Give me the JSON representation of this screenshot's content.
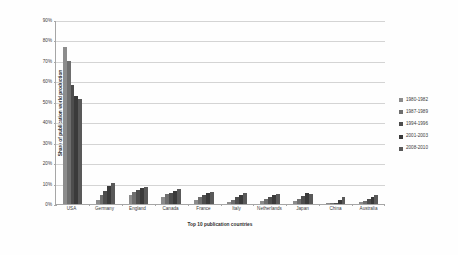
{
  "chart_data": {
    "type": "bar",
    "title": "",
    "subtitle": "",
    "xlabel": "Top 10 publication countries",
    "ylabel": "Share of publication world production",
    "categories": [
      "USA",
      "Germany",
      "England",
      "Canada",
      "France",
      "Italy",
      "Netherlands",
      "Japan",
      "China",
      "Australia"
    ],
    "ylim": [
      0,
      90
    ],
    "ytick_labels": [
      "90%",
      "80%",
      "70%",
      "60%",
      "50%",
      "40%",
      "30%",
      "20%",
      "10%",
      "0%"
    ],
    "ytick_values": [
      90,
      80,
      70,
      60,
      50,
      40,
      30,
      20,
      10,
      0
    ],
    "yaxis_unit": "%",
    "grid": true,
    "grid_axis": "y",
    "legend_position": "right",
    "series": [
      {
        "name": "1980-1982",
        "color": "#8c8c8c",
        "values": [
          77.0,
          2.0,
          4.5,
          3.6,
          2.2,
          1.0,
          1.4,
          1.6,
          0.2,
          1.0
        ]
      },
      {
        "name": "1987-1989",
        "color": "#6e6e6e",
        "values": [
          70.0,
          4.2,
          6.0,
          4.8,
          3.2,
          2.0,
          2.6,
          2.6,
          0.3,
          1.6
        ]
      },
      {
        "name": "1994-1996",
        "color": "#4d4d4d",
        "values": [
          58.0,
          6.6,
          7.0,
          5.6,
          4.6,
          3.4,
          3.6,
          4.0,
          0.5,
          2.4
        ]
      },
      {
        "name": "2001-2003",
        "color": "#3a3a3a",
        "values": [
          53.0,
          9.0,
          7.8,
          6.4,
          5.4,
          4.6,
          4.4,
          5.6,
          2.0,
          3.2
        ]
      },
      {
        "name": "2008-2010",
        "color": "#595959",
        "values": [
          51.5,
          10.2,
          8.4,
          7.4,
          5.8,
          5.6,
          5.0,
          5.0,
          3.4,
          4.2
        ]
      }
    ]
  },
  "axis": {
    "x_title": "Top 10 publication countries",
    "y_title": "Share of publication world production"
  }
}
